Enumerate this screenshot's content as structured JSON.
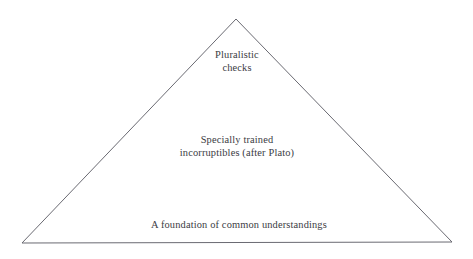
{
  "diagram": {
    "type": "pyramid",
    "title": "",
    "background_color": "#ffffff",
    "stroke_color": "#6a6a72",
    "text_color": "#3b3b43",
    "geometry": {
      "apex": {
        "x": 236,
        "y": 19
      },
      "bottom_left": {
        "x": 22,
        "y": 243
      },
      "bottom_right": {
        "x": 452,
        "y": 242
      }
    },
    "tiers": [
      {
        "id": "apex",
        "lines": [
          "Pluralistic",
          "checks"
        ]
      },
      {
        "id": "middle",
        "lines": [
          "Specially trained",
          "incorruptibles (after Plato)"
        ]
      },
      {
        "id": "base",
        "lines": [
          "A foundation of common understandings"
        ]
      }
    ]
  }
}
